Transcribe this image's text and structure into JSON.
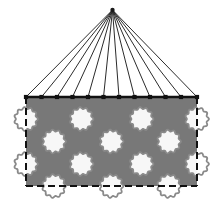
{
  "figure": {
    "title": "Cable-suspended perforated panel",
    "canvas": {
      "width": 221,
      "height": 208,
      "background": "#ffffff"
    }
  },
  "colors": {
    "panel_fill": "#787878",
    "panel_edge": "#111111",
    "hole_fill": "#f7f7f7",
    "hole_edge": "#8a8a8a",
    "cable": "#2b2b2b",
    "node": "#111111",
    "apex": "#1a1a1a"
  },
  "apex": {
    "label": "apex-suspension-point",
    "x": 112.5,
    "y": 10.0,
    "radius": 2.2
  },
  "panel": {
    "label": "perforated-panel",
    "x": 26.0,
    "y": 97.0,
    "width": 171.0,
    "height": 89.0,
    "fill": "#787878",
    "edge_style": "dashed",
    "dash_pattern": "7 4",
    "edge_width": 2.0,
    "top_edge_style": "solid",
    "top_edge_width": 2.6
  },
  "cables": {
    "label": "suspension-cables",
    "count": 12,
    "stroke_width": 1.0,
    "anchor_y": 97.0,
    "anchor_x": [
      26.0,
      41.5,
      57.0,
      72.5,
      88.0,
      103.5,
      119.0,
      134.5,
      150.0,
      165.5,
      181.0,
      197.0
    ]
  },
  "nodes": {
    "label": "cable-anchor-nodes",
    "shape": "square",
    "size": 4.2,
    "count": 12
  },
  "holes": {
    "label": "panel-perforations",
    "radius": 11.0,
    "scallop_count": 11,
    "scallop_amplitude": 0.9,
    "rows": [
      {
        "row": 1,
        "y": 119.0,
        "cx": [
          26.0,
          81.5,
          141.5,
          197.0
        ]
      },
      {
        "row": 2,
        "y": 141.5,
        "cx": [
          54.0,
          111.5,
          169.0
        ]
      },
      {
        "row": 3,
        "y": 164.0,
        "cx": [
          26.0,
          81.5,
          141.5,
          197.0
        ]
      },
      {
        "row": 4,
        "y": 186.0,
        "cx": [
          54.0,
          111.5,
          169.0
        ]
      }
    ]
  },
  "legend": {
    "apex_name": "apex",
    "cable_name": "cable",
    "panel_name": "panel",
    "hole_name": "hole"
  }
}
